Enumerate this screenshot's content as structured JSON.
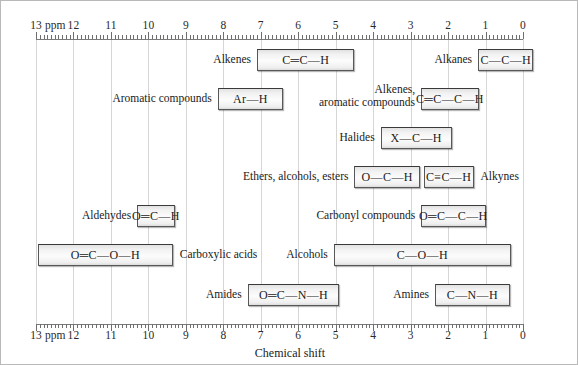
{
  "chart_data": {
    "type": "bar",
    "title": "",
    "xlabel": "Chemical shift",
    "ylabel": "",
    "xlim": [
      13,
      0
    ],
    "axis_unit": "ppm",
    "axis_reversed": true,
    "grid": true,
    "legend": "none",
    "tick_labels_top": [
      "13",
      "12",
      "11",
      "10",
      "9",
      "8",
      "7",
      "6",
      "5",
      "4",
      "3",
      "2",
      "1",
      "0"
    ],
    "tick_labels_bottom": [
      "13",
      "12",
      "11",
      "10",
      "9",
      "8",
      "7",
      "6",
      "5",
      "4",
      "3",
      "2",
      "1",
      "0"
    ],
    "ppm_word": "ppm",
    "minor_ticks_per_unit": 10,
    "bars": [
      {
        "id": "alkenes",
        "label": "Alkenes",
        "formula": "C═C—H",
        "row": 1,
        "start_ppm": 7.1,
        "end_ppm": 4.5,
        "label_side": "left"
      },
      {
        "id": "alkanes",
        "label": "Alkanes",
        "formula": "C—C—H",
        "row": 1,
        "start_ppm": 1.2,
        "end_ppm": -0.28,
        "label_side": "left"
      },
      {
        "id": "aromatic-compounds",
        "label": "Aromatic compounds",
        "formula": "Ar—H",
        "row": 2,
        "start_ppm": 8.15,
        "end_ppm": 6.4,
        "label_side": "left"
      },
      {
        "id": "alkenes-aromatic-compounds",
        "label": "Alkenes,\naromatic compounds",
        "label_lines": [
          "Alkenes,",
          "aromatic compounds"
        ],
        "formula": "C═C—C—H",
        "row": 2,
        "start_ppm": 2.72,
        "end_ppm": 1.18,
        "label_side": "left"
      },
      {
        "id": "halides",
        "label": "Halides",
        "formula": "X—C—H",
        "row": 3,
        "start_ppm": 3.8,
        "end_ppm": 1.9,
        "label_side": "left"
      },
      {
        "id": "ethers-alcohols-esters",
        "label": "Ethers, alcohols, esters",
        "formula": "O—C—H",
        "row": 4,
        "start_ppm": 4.5,
        "end_ppm": 2.75,
        "label_side": "left"
      },
      {
        "id": "alkynes",
        "label": "Alkynes",
        "formula": "C≡C—H",
        "row": 4,
        "start_ppm": 2.65,
        "end_ppm": 1.32,
        "label_side": "right"
      },
      {
        "id": "aldehydes",
        "label": "Aldehydes",
        "formula": "O═C—H",
        "row": 5,
        "start_ppm": 10.3,
        "end_ppm": 9.3,
        "label_side": "left"
      },
      {
        "id": "carbonyl-compounds",
        "label": "Carbonyl compounds",
        "formula": "O═C—C—H",
        "row": 5,
        "start_ppm": 2.72,
        "end_ppm": 1.0,
        "label_side": "left"
      },
      {
        "id": "carboxylic-acids",
        "label": "Carboxylic acids",
        "formula": "O═C—O—H",
        "row": 6,
        "start_ppm": 12.95,
        "end_ppm": 9.35,
        "label_side": "right"
      },
      {
        "id": "alcohols",
        "label": "Alcohols",
        "formula": "C—O—H",
        "row": 6,
        "start_ppm": 5.05,
        "end_ppm": 0.32,
        "label_side": "left"
      },
      {
        "id": "amides",
        "label": "Amides",
        "formula": "O═C—N—H",
        "row": 7,
        "start_ppm": 7.35,
        "end_ppm": 4.9,
        "label_side": "left"
      },
      {
        "id": "amines",
        "label": "Amines",
        "formula": "C—N—H",
        "row": 7,
        "start_ppm": 2.35,
        "end_ppm": 0.35,
        "label_side": "left"
      }
    ]
  }
}
